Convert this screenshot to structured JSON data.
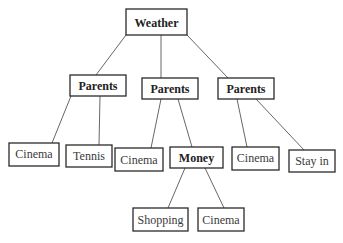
{
  "diagram": {
    "type": "decision-tree",
    "nodes": {
      "root": {
        "label": "Weather",
        "bold": true
      },
      "parents_left": {
        "label": "Parents",
        "bold": true
      },
      "parents_mid": {
        "label": "Parents",
        "bold": true
      },
      "parents_right": {
        "label": "Parents",
        "bold": true
      },
      "leaf_cinema_1": {
        "label": "Cinema",
        "bold": false
      },
      "leaf_tennis": {
        "label": "Tennis",
        "bold": false
      },
      "leaf_cinema_2": {
        "label": "Cinema",
        "bold": false
      },
      "money": {
        "label": "Money",
        "bold": true
      },
      "leaf_cinema_3": {
        "label": "Cinema",
        "bold": false
      },
      "leaf_stay_in": {
        "label": "Stay in",
        "bold": false
      },
      "leaf_shopping": {
        "label": "Shopping",
        "bold": false
      },
      "leaf_cinema_4": {
        "label": "Cinema",
        "bold": false
      }
    },
    "edges": [
      [
        "root",
        "parents_left"
      ],
      [
        "root",
        "parents_mid"
      ],
      [
        "root",
        "parents_right"
      ],
      [
        "parents_left",
        "leaf_cinema_1"
      ],
      [
        "parents_left",
        "leaf_tennis"
      ],
      [
        "parents_mid",
        "leaf_cinema_2"
      ],
      [
        "parents_mid",
        "money"
      ],
      [
        "parents_right",
        "leaf_cinema_3"
      ],
      [
        "parents_right",
        "leaf_stay_in"
      ],
      [
        "money",
        "leaf_shopping"
      ],
      [
        "money",
        "leaf_cinema_4"
      ]
    ]
  }
}
